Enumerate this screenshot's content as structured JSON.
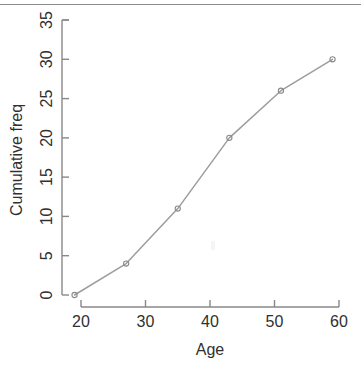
{
  "chart_data": {
    "type": "line",
    "title": "",
    "xlabel": "Age",
    "ylabel": "Cumulative freq",
    "x": [
      19,
      27,
      35,
      43,
      51,
      59
    ],
    "values": [
      0,
      4,
      11,
      20,
      26,
      30
    ],
    "series": [
      {
        "name": "Cumulative frequency",
        "x": [
          19,
          27,
          35,
          43,
          51,
          59
        ],
        "values": [
          0,
          4,
          11,
          20,
          26,
          30
        ]
      }
    ],
    "xlim": [
      19,
      60
    ],
    "ylim": [
      0,
      35
    ],
    "xticks": [
      20,
      30,
      40,
      50,
      60
    ],
    "yticks": [
      0,
      5,
      10,
      15,
      20,
      25,
      30,
      35
    ],
    "xtick_labels": [
      "20",
      "30",
      "40",
      "50",
      "60"
    ],
    "ytick_labels": [
      "0",
      "5",
      "10",
      "15",
      "20",
      "25",
      "30",
      "35"
    ],
    "grid": false,
    "legend": false,
    "legend_position": "none",
    "marker": "open-circle",
    "line_color": "#9d9d9d",
    "axis_color": "#888888",
    "text_color": "#303030",
    "background": "#ffffff"
  },
  "axes": {
    "x_title": "Age",
    "y_title": "Cumulative freq"
  },
  "page": {
    "bottom_fragment": ""
  }
}
